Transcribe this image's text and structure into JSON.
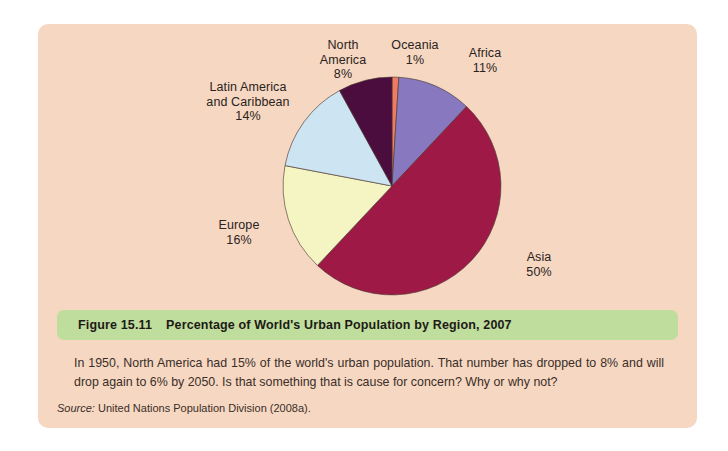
{
  "figure": {
    "number": "Figure 15.11",
    "title": "Percentage of World's Urban Population by Region, 2007",
    "body": "In 1950, North America had 15% of the world's urban population. That number has dropped to 8% and will drop again to 6% by 2050. Is that something that is cause for concern? Why or why not?",
    "source_label": "Source:",
    "source_text": "United Nations Population Division (2008a)."
  },
  "colors": {
    "page_background": "#ffffff",
    "panel_background": "#f6d7c2",
    "caption_bar": "#bfdd9c",
    "text": "#2a2320"
  },
  "chart_data": {
    "type": "pie",
    "title": "Percentage of World's Urban Population by Region, 2007",
    "start_angle_deg": 0,
    "direction": "clockwise",
    "legend": "none",
    "labels_position": "outside",
    "categories": [
      "Oceania",
      "Africa",
      "Asia",
      "Europe",
      "Latin America and Caribbean",
      "North America"
    ],
    "values": [
      1,
      11,
      50,
      16,
      14,
      8
    ],
    "unit": "%",
    "slice_colors": [
      "#f07a62",
      "#8878c0",
      "#9e1945",
      "#f5f5c4",
      "#cde4f2",
      "#4a0d3d"
    ],
    "slices": [
      {
        "name": "Oceania",
        "value": 1,
        "label": "Oceania\n1%",
        "color": "#f07a62"
      },
      {
        "name": "Africa",
        "value": 11,
        "label": "Africa\n11%",
        "color": "#8878c0"
      },
      {
        "name": "Asia",
        "value": 50,
        "label": "Asia\n50%",
        "color": "#9e1945"
      },
      {
        "name": "Europe",
        "value": 16,
        "label": "Europe\n16%",
        "color": "#f5f5c4"
      },
      {
        "name": "Latin America and Caribbean",
        "value": 14,
        "label": "Latin America\nand Caribbean\n14%",
        "color": "#cde4f2"
      },
      {
        "name": "North America",
        "value": 8,
        "label": "North\nAmerica\n8%",
        "color": "#4a0d3d"
      }
    ]
  }
}
